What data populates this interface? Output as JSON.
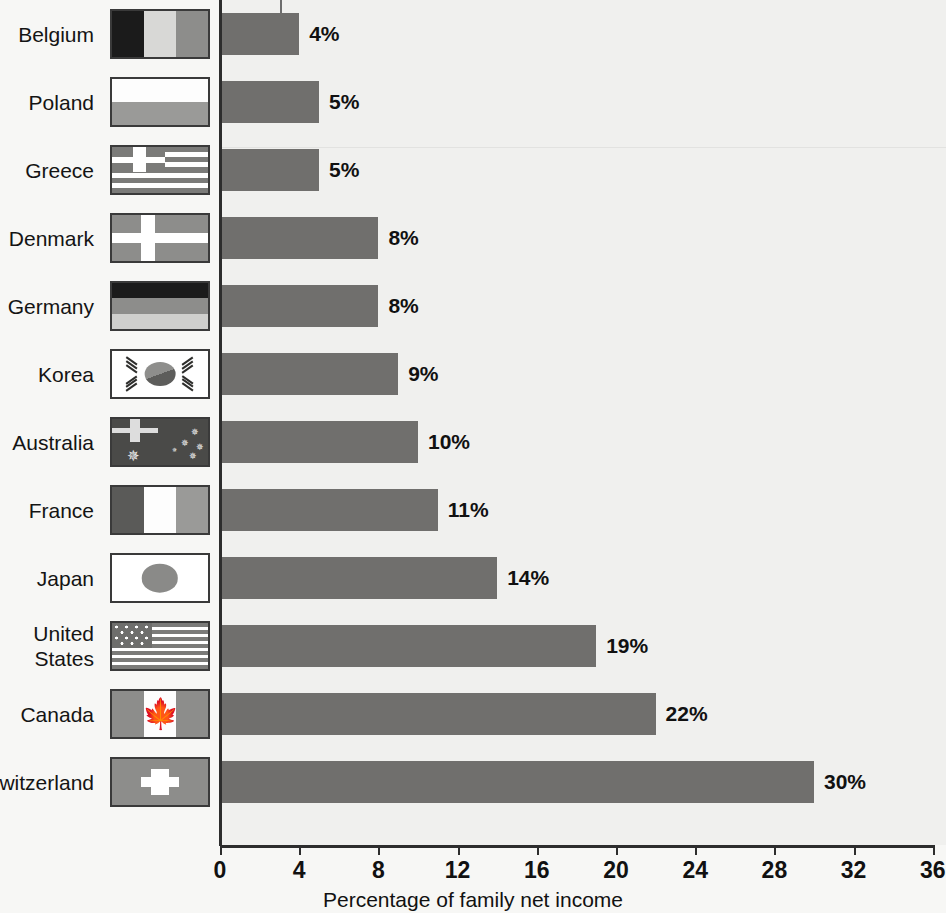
{
  "chart_data": {
    "type": "bar",
    "orientation": "horizontal",
    "title": "",
    "xlabel": "Percentage of family net income",
    "ylabel": "",
    "xlim": [
      0,
      36
    ],
    "xticks": [
      0,
      4,
      8,
      12,
      16,
      20,
      24,
      28,
      32,
      36
    ],
    "grid": false,
    "legend": "none",
    "categories": [
      "Belgium",
      "Poland",
      "Greece",
      "Denmark",
      "Germany",
      "Korea",
      "Australia",
      "France",
      "Japan",
      "United States",
      "Canada",
      "Switzerland"
    ],
    "values": [
      4,
      5,
      5,
      8,
      8,
      9,
      10,
      11,
      14,
      19,
      22,
      30
    ],
    "value_labels": [
      "4%",
      "5%",
      "5%",
      "8%",
      "8%",
      "9%",
      "10%",
      "11%",
      "14%",
      "19%",
      "22%",
      "30%"
    ],
    "bar_color": "#706f6d",
    "background_color": "#f0f0ee",
    "axis_color": "#2d2d2d"
  },
  "axis": {
    "title": "Percentage of family net income",
    "ticks": [
      "0",
      "4",
      "8",
      "12",
      "16",
      "20",
      "24",
      "28",
      "32",
      "36"
    ]
  },
  "rows": [
    {
      "label": "Belgium",
      "value_label": "4%",
      "value": 4,
      "flag": "belgium-flag"
    },
    {
      "label": "Poland",
      "value_label": "5%",
      "value": 5,
      "flag": "poland-flag"
    },
    {
      "label": "Greece",
      "value_label": "5%",
      "value": 5,
      "flag": "greece-flag"
    },
    {
      "label": "Denmark",
      "value_label": "8%",
      "value": 8,
      "flag": "denmark-flag"
    },
    {
      "label": "Germany",
      "value_label": "8%",
      "value": 8,
      "flag": "germany-flag"
    },
    {
      "label": "Korea",
      "value_label": "9%",
      "value": 9,
      "flag": "korea-flag"
    },
    {
      "label": "Australia",
      "value_label": "10%",
      "value": 10,
      "flag": "australia-flag"
    },
    {
      "label": "France",
      "value_label": "11%",
      "value": 11,
      "flag": "france-flag"
    },
    {
      "label": "Japan",
      "value_label": "14%",
      "value": 14,
      "flag": "japan-flag"
    },
    {
      "label": "United\nStates",
      "value_label": "19%",
      "value": 19,
      "flag": "united-states-flag"
    },
    {
      "label": "Canada",
      "value_label": "22%",
      "value": 22,
      "flag": "canada-flag"
    },
    {
      "label": "Switzerland",
      "value_label": "30%",
      "value": 30,
      "flag": "switzerland-flag"
    }
  ]
}
